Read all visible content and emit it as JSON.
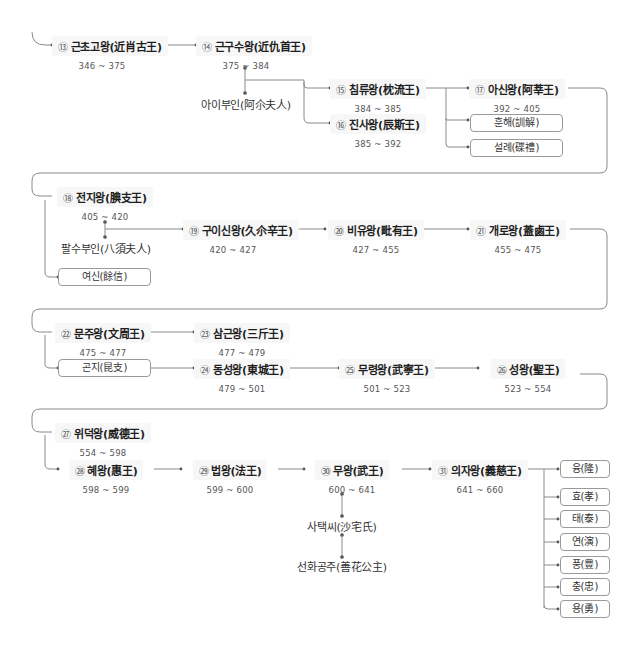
{
  "kings": {
    "k13": {
      "num": "⑬",
      "name": "근초고왕(近肖古王)",
      "years": "346 ~ 375"
    },
    "k14": {
      "num": "⑭",
      "name": "근구수왕(近仇首王)",
      "years": "375 ~ 384"
    },
    "k15": {
      "num": "⑮",
      "name": "침류왕(枕流王)",
      "years": "384 ~ 385"
    },
    "k16": {
      "num": "⑯",
      "name": "진사왕(辰斯王)",
      "years": "385 ~ 392"
    },
    "k17": {
      "num": "⑰",
      "name": "아신왕(阿莘王)",
      "years": "392 ~ 405"
    },
    "k18": {
      "num": "⑱",
      "name": "전지왕(腆支王)",
      "years": "405 ~ 420"
    },
    "k19": {
      "num": "⑲",
      "name": "구이신왕(久尒辛王)",
      "years": "420 ~ 427"
    },
    "k20": {
      "num": "⑳",
      "name": "비유왕(毗有王)",
      "years": "427 ~ 455"
    },
    "k21": {
      "num": "㉑",
      "name": "개로왕(蓋鹵王)",
      "years": "455 ~ 475"
    },
    "k22": {
      "num": "㉒",
      "name": "문주왕(文周王)",
      "years": "475 ~ 477"
    },
    "k23": {
      "num": "㉓",
      "name": "삼근왕(三斤王)",
      "years": "477 ~ 479"
    },
    "k24": {
      "num": "㉔",
      "name": "동성왕(東城王)",
      "years": "479 ~ 501"
    },
    "k25": {
      "num": "㉕",
      "name": "무령왕(武寧王)",
      "years": "501 ~ 523"
    },
    "k26": {
      "num": "㉖",
      "name": "성왕(聖王)",
      "years": "523 ~ 554"
    },
    "k27": {
      "num": "㉗",
      "name": "위덕왕(威德王)",
      "years": "554 ~ 598"
    },
    "k28": {
      "num": "㉘",
      "name": "혜왕(惠王)",
      "years": "598 ~ 599"
    },
    "k29": {
      "num": "㉙",
      "name": "법왕(法王)",
      "years": "599 ~ 600"
    },
    "k30": {
      "num": "㉚",
      "name": "무왕(武王)",
      "years": "600 ~ 641"
    },
    "k31": {
      "num": "㉛",
      "name": "의자왕(義慈王)",
      "years": "641 ~ 660"
    }
  },
  "spouses": {
    "aii": "아이부인(阿尒夫人)",
    "palsu": "팔수부인(八須夫人)",
    "sataek": "사택씨(沙宅氏)",
    "seonhwa": "선화공주(善花公主)"
  },
  "boxes": {
    "hunhae": "훈해(訓解)",
    "seollye": "설례(碟禮)",
    "yeosin": "여신(餘信)",
    "gonji": "곤지(昆支)"
  },
  "sons_of_uija": [
    "융(隆)",
    "효(孝)",
    "태(泰)",
    "연(演)",
    "풍(豊)",
    "충(忠)",
    "용(勇)"
  ],
  "colors": {
    "line": "#8a8a8a",
    "box_border": "#9a9a9a",
    "name_bg": "#f7f7f7"
  }
}
